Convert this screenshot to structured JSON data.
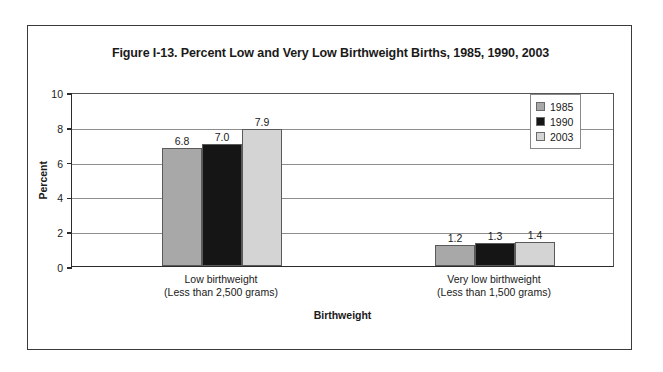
{
  "figure": {
    "title": "Figure I-13. Percent Low and Very Low Birthweight Births, 1985, 1990, 2003"
  },
  "chart_data": {
    "type": "bar",
    "title": "Figure I-13. Percent Low and Very Low Birthweight Births, 1985, 1990, 2003",
    "xlabel": "Birthweight",
    "ylabel": "Percent",
    "categories": [
      "Low birthweight\n(Less than 2,500 grams)",
      "Very low birthweight\n(Less than 1,500 grams)"
    ],
    "category_lines": [
      [
        "Low birthweight",
        "(Less than 2,500 grams)"
      ],
      [
        "Very low birthweight",
        "(Less than 1,500 grams)"
      ]
    ],
    "series": [
      {
        "name": "1985",
        "values": [
          6.8,
          1.2
        ],
        "color": "#a8a8a8"
      },
      {
        "name": "1990",
        "values": [
          7.0,
          1.3
        ],
        "color": "#151515"
      },
      {
        "name": "2003",
        "values": [
          7.9,
          1.4
        ],
        "color": "#d4d4d4"
      }
    ],
    "data_labels": [
      "6.8",
      "7.0",
      "7.9",
      "1.2",
      "1.3",
      "1.4"
    ],
    "ylim": [
      0,
      10
    ],
    "yticks": [
      0,
      2,
      4,
      6,
      8,
      10
    ],
    "ytick_labels": [
      "0",
      "2",
      "4",
      "6",
      "8",
      "10"
    ],
    "grid": true,
    "grid_axis": "y",
    "legend_position": "top-right",
    "legend": [
      "1985",
      "1990",
      "2003"
    ]
  },
  "colors": {
    "series_1985": "#a8a8a8",
    "series_1990": "#151515",
    "series_2003": "#d4d4d4",
    "axis": "#2b2b2b",
    "gridline": "#8d8d8d",
    "frame": "#3a3a3a",
    "text": "#1a1a1a"
  }
}
